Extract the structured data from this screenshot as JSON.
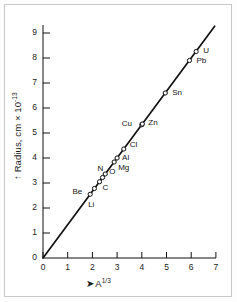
{
  "figure": {
    "background_color": "#ffffff",
    "border_color": "#c9c9c9",
    "line_color": "#111111",
    "text_color": "#1a1a1a"
  },
  "axes": {
    "y_label_prefix": "Radius, cm × 10",
    "y_label_exponent": "-13",
    "y_arrow": "↑",
    "x_label_base": "A",
    "x_label_exponent": "1/3",
    "x_arrow": "➤",
    "x_ticks": [
      "0",
      "1",
      "2",
      "3",
      "4",
      "5",
      "6",
      "7"
    ],
    "y_ticks": [
      "0",
      "1",
      "2",
      "3",
      "4",
      "5",
      "6",
      "7",
      "8",
      "9"
    ]
  },
  "chart_data": {
    "type": "scatter",
    "title": "",
    "subtitle": "",
    "xlabel": "A^(1/3)",
    "ylabel": "Radius, cm × 10^-13",
    "xlim": [
      0,
      7
    ],
    "ylim": [
      0,
      9.4
    ],
    "grid": false,
    "legend": "none",
    "annotations": [
      "Straight line through origin: R = r0 * A^(1/3)"
    ],
    "series": [
      {
        "name": "Nuclear radius data",
        "marker": "open-circle",
        "points": [
          {
            "label": "Li",
            "x": 1.91,
            "y": 2.55,
            "label_dx": -2,
            "label_dy": 11
          },
          {
            "label": "Be",
            "x": 2.08,
            "y": 2.78,
            "label_dx": -22,
            "label_dy": 3
          },
          {
            "label": "C",
            "x": 2.29,
            "y": 3.05,
            "label_dx": 3,
            "label_dy": 6
          },
          {
            "label": "N",
            "x": 2.41,
            "y": 3.22,
            "label_dx": -5,
            "label_dy": -9
          },
          {
            "label": "O",
            "x": 2.52,
            "y": 3.36,
            "label_dx": 4,
            "label_dy": -2
          },
          {
            "label": "Mg",
            "x": 2.88,
            "y": 3.84,
            "label_dx": 4,
            "label_dy": 6
          },
          {
            "label": "Al",
            "x": 3.0,
            "y": 4.0,
            "label_dx": 5,
            "label_dy": 0
          },
          {
            "label": "Cl",
            "x": 3.27,
            "y": 4.36,
            "label_dx": 6,
            "label_dy": -4
          },
          {
            "label": "Cu",
            "x": 4.0,
            "y": 5.33,
            "label_dx": -20,
            "label_dy": -1
          },
          {
            "label": "Zn",
            "x": 4.02,
            "y": 5.36,
            "label_dx": 6,
            "label_dy": -1
          },
          {
            "label": "Sn",
            "x": 4.95,
            "y": 6.6,
            "label_dx": 7,
            "label_dy": 0
          },
          {
            "label": "Pb",
            "x": 5.93,
            "y": 7.9,
            "label_dx": 7,
            "label_dy": 0
          },
          {
            "label": "U",
            "x": 6.2,
            "y": 8.26,
            "label_dx": 7,
            "label_dy": -1
          }
        ]
      }
    ],
    "fit_line": {
      "x_start": 0.0,
      "y_start": 0.0,
      "x_end": 6.95,
      "y_end": 9.27,
      "slope": 1.333
    }
  }
}
